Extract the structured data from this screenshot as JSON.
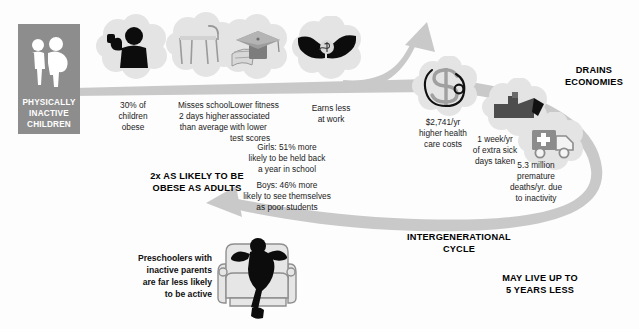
{
  "meta": {
    "background_color": "#fdfdfd",
    "ribbon_color": "#c9c9c9",
    "cloud_color": "#e3e3e3",
    "badge_color": "#8d8d8d",
    "text_color": "#1b1b1b"
  },
  "badge": {
    "line1": "PHYSICALLY",
    "line2": "INACTIVE",
    "line3": "CHILDREN",
    "icon": "two-children-silhouette-icon"
  },
  "nodes": [
    {
      "id": "obese",
      "icon": "flexing-child-silhouette-icon",
      "caption": "30% of\nchildren\nobese",
      "lines": [
        "30% of",
        "children",
        "obese"
      ]
    },
    {
      "id": "school",
      "icon": "empty-school-desk-icon",
      "caption": "Misses school\n2 days higher\nthan average",
      "lines": [
        "Misses school",
        "2 days higher",
        "than average"
      ]
    },
    {
      "id": "fitness",
      "icon": "graduation-cap-diploma-icon",
      "caption": "Lower fitness\nassociated\nwith lower\ntest scores",
      "lines": [
        "Lower fitness",
        "associated",
        "with lower",
        "test scores"
      ]
    },
    {
      "id": "earns",
      "icon": "hands-exchanging-money-icon",
      "caption": "Earns less\nat work",
      "lines": [
        "Earns less",
        "at work"
      ]
    },
    {
      "id": "healthcost",
      "icon": "dollar-sign-stethoscope-icon",
      "caption": "$2,741/yr\nhigher health\ncare costs",
      "lines": [
        "$2,741/yr",
        "higher health",
        "care costs"
      ]
    },
    {
      "id": "sickdays",
      "icon": "factory-industry-icon",
      "caption": "1 week/yr\nof extra sick\ndays taken",
      "lines": [
        "1 week/yr",
        "of extra sick",
        "days taken"
      ]
    },
    {
      "id": "deaths",
      "icon": "ambulance-icon",
      "caption": "5.3 million\npremature\ndeaths/yr. due\nto inactivity",
      "lines": [
        "5.3 million",
        "premature",
        "deaths/yr. due",
        "to inactivity"
      ]
    }
  ],
  "stats": {
    "girls": {
      "lines": [
        "Girls: 51% more",
        "likely to be held back",
        "a year in school"
      ]
    },
    "boys": {
      "lines": [
        "Boys: 46% more",
        "likely to see themselves",
        "as poor students"
      ]
    }
  },
  "headings": {
    "obese_adults": {
      "lines": [
        "2x AS LIKELY TO BE",
        "OBESE AS ADULTS"
      ]
    },
    "drains": {
      "lines": [
        "DRAINS",
        "ECONOMIES"
      ]
    },
    "cycle": {
      "lines": [
        "INTERGENERATIONAL",
        "CYCLE"
      ]
    },
    "live_less": {
      "lines": [
        "MAY LIVE UP TO",
        "5 YEARS LESS"
      ]
    }
  },
  "preschool": {
    "lines": [
      "Preschoolers with",
      "inactive parents",
      "are far less likely",
      "to be active"
    ],
    "icon": "person-slouching-on-armchair-icon"
  }
}
